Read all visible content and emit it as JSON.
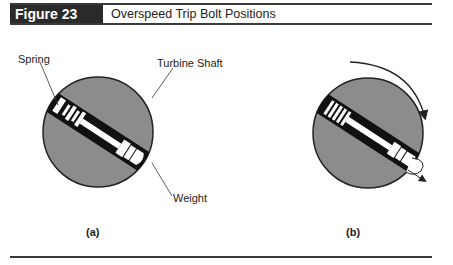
{
  "header": {
    "figure_label": "Figure 23",
    "title": "Overspeed Trip Bolt Positions"
  },
  "panels": [
    {
      "caption": "(a)",
      "state": "normal",
      "labels": {
        "spring": "Spring",
        "shaft": "Turbine Shaft",
        "weight": "Weight"
      }
    },
    {
      "caption": "(b)",
      "state": "tripped",
      "indicators": [
        "rotation-arrow",
        "outward-motion-arrow"
      ]
    }
  ],
  "colors": {
    "header_bg": "#2a2a2a",
    "shaft_fill": "#8c8c8c",
    "bore_fill": "#111111",
    "bolt_fill": "#ffffff",
    "line": "#3a3a3a"
  }
}
